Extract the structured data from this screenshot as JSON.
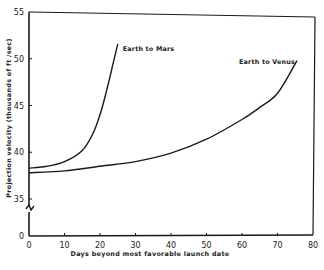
{
  "chart_data": {
    "type": "line",
    "title": "",
    "xlabel": "Days beyond most favorable launch date",
    "ylabel": "Projection velocity (thousands of ft /sec)",
    "xlim": [
      0,
      80
    ],
    "ylim": [
      0,
      55
    ],
    "y_axis_break": [
      0,
      35
    ],
    "grid": false,
    "x_ticks": [
      0,
      10,
      20,
      30,
      40,
      50,
      60,
      70,
      80
    ],
    "x_tick_labels": [
      "0",
      "10",
      "20",
      "30",
      "40",
      "50",
      "60",
      "70",
      "80"
    ],
    "y_ticks": [
      0,
      35,
      40,
      45,
      50,
      55
    ],
    "y_tick_labels": [
      "0",
      "35",
      "40",
      "45",
      "50",
      "55"
    ],
    "series": [
      {
        "name": "Earth to Mars",
        "x": [
          0,
          5,
          10,
          15,
          18,
          20,
          22,
          24,
          25
        ],
        "y": [
          38.3,
          38.5,
          39.0,
          40.2,
          42.0,
          44.0,
          46.8,
          50.0,
          51.6
        ]
      },
      {
        "name": "Earth to Venus",
        "x": [
          0,
          10,
          20,
          30,
          40,
          50,
          60,
          65,
          70,
          75.5
        ],
        "y": [
          37.8,
          38.0,
          38.5,
          39.0,
          39.9,
          41.4,
          43.5,
          44.8,
          46.3,
          49.8
        ]
      }
    ],
    "annotations": [
      {
        "text": "Earth to Mars",
        "series": "Earth to Mars",
        "placement": "right of curve end"
      },
      {
        "text": "Earth to Venus",
        "series": "Earth to Venus",
        "placement": "left of curve end"
      }
    ]
  }
}
